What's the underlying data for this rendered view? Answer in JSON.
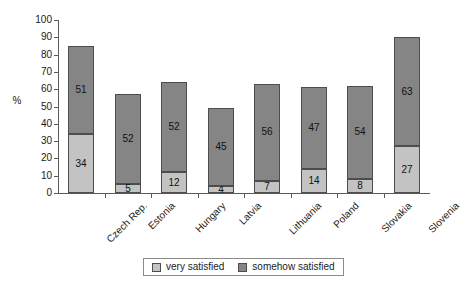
{
  "chart_data": {
    "type": "bar",
    "subtype": "stacked-bar",
    "title": "",
    "xlabel": "",
    "ylabel": "%",
    "ylim": [
      0,
      100
    ],
    "ytick_step": 10,
    "yticks": [
      0,
      10,
      20,
      30,
      40,
      50,
      60,
      70,
      80,
      90,
      100
    ],
    "grid": false,
    "legend_position": "bottom-center",
    "categories": [
      "Czech Rep.",
      "Estonia",
      "Hungary",
      "Latvia",
      "Lithuania",
      "Poland",
      "Slovakia",
      "Slovenia"
    ],
    "series": [
      {
        "name": "very satisfied",
        "color": "#c3c3c3",
        "values": [
          34,
          5,
          12,
          4,
          7,
          14,
          8,
          27
        ]
      },
      {
        "name": "somehow satisfied",
        "color": "#858585",
        "values": [
          51,
          52,
          52,
          45,
          56,
          47,
          54,
          63
        ]
      }
    ],
    "totals": [
      85,
      57,
      64,
      49,
      63,
      61,
      62,
      90
    ]
  },
  "legend": {
    "items": [
      {
        "label": "very satisfied",
        "swatch": "low"
      },
      {
        "label": "somehow satisfied",
        "swatch": "high"
      }
    ]
  },
  "axis": {
    "y_title": "%"
  }
}
